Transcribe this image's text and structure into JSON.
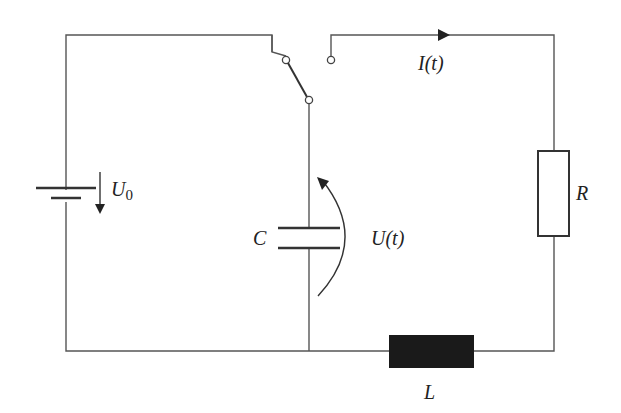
{
  "diagram": {
    "type": "circuit",
    "components": {
      "battery": {
        "label": "U",
        "subscript": "0"
      },
      "capacitor": {
        "label": "C",
        "voltage_label": "U(t)"
      },
      "resistor": {
        "label": "R"
      },
      "inductor": {
        "label": "L"
      },
      "current": {
        "label": "I(t)"
      }
    },
    "colors": {
      "wire": "#555555",
      "inductor_fill": "#1a1a1a",
      "text": "#222222"
    }
  }
}
